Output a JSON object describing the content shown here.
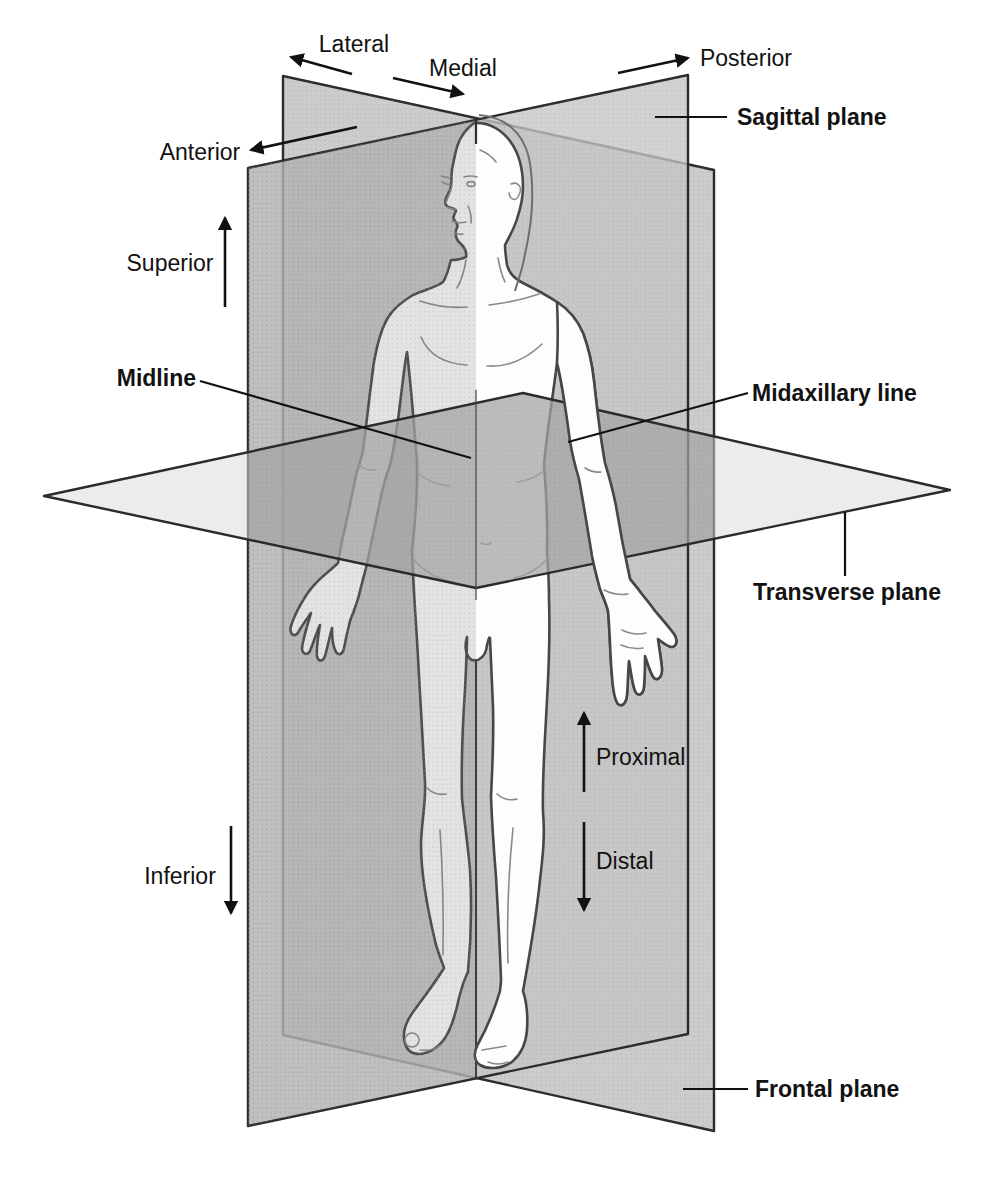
{
  "directional_terms": {
    "lateral": "Lateral",
    "medial": "Medial",
    "posterior": "Posterior",
    "anterior": "Anterior",
    "superior": "Superior",
    "inferior": "Inferior",
    "proximal": "Proximal",
    "distal": "Distal"
  },
  "reference_lines": {
    "midline": "Midline",
    "midaxillary": "Midaxillary line"
  },
  "planes": {
    "sagittal": "Sagittal plane",
    "transverse": "Transverse plane",
    "frontal": "Frontal plane"
  },
  "colors": {
    "background": "#ffffff",
    "plane_fill": "#c9c9c9",
    "plane_fill_2": "#c5c5c5",
    "plane_edge": "#2b2b2b",
    "plane_dark_overlay": "#707070",
    "transverse_fill": "#dcdcdc",
    "body_fill": "#fdfdfd",
    "body_outline": "#474747",
    "detail_line": "#8a8a8a",
    "label_text": "#121212",
    "arrow": "#111111",
    "shade_overlay": "#6e6e6e"
  }
}
